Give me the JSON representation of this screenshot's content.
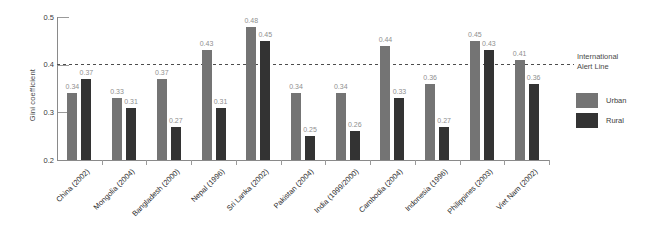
{
  "chart_data": {
    "type": "bar",
    "title": "",
    "ylabel": "Gini coefficient",
    "xlabel": "",
    "ylim": [
      0.2,
      0.5
    ],
    "yticks": [
      0.2,
      0.3,
      0.4,
      0.5
    ],
    "grid": false,
    "legend_position": "right",
    "reference_line": {
      "value": 0.4,
      "label": "International Alert Line",
      "style": "dashed",
      "color": "#4d4d4d"
    },
    "categories": [
      "China (2002)",
      "Mongolia (2004)",
      "Bangladesh (2000)",
      "Nepal (1996)",
      "Sri Lanka (2002)",
      "Pakistan (2004)",
      "India (1999/2000)",
      "Cambodia (2004)",
      "Indonesia (1996)",
      "Philippines (2003)",
      "Viet Nam (2002)"
    ],
    "series": [
      {
        "name": "Urban",
        "color": "#747474",
        "values": [
          0.34,
          0.33,
          0.37,
          0.43,
          0.48,
          0.34,
          0.34,
          0.44,
          0.36,
          0.45,
          0.41
        ]
      },
      {
        "name": "Rural",
        "color": "#333333",
        "values": [
          0.37,
          0.31,
          0.27,
          0.31,
          0.45,
          0.25,
          0.26,
          0.33,
          0.27,
          0.43,
          0.36
        ]
      }
    ],
    "bar_label_color": "#8f8f8f",
    "axis_color": "#8a8a8a"
  }
}
